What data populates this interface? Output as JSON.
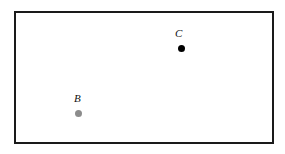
{
  "figure": {
    "type": "geometry-diagram",
    "background_color": "#ffffff",
    "frame": {
      "name": "bounding-rectangle",
      "x": 14,
      "y": 11,
      "width": 256,
      "height": 129,
      "border_color": "#1a1a1a",
      "border_width": 2,
      "fill_color": "#ffffff"
    },
    "points": [
      {
        "label": "C",
        "color": "#000000",
        "radius": 3.5,
        "cx": 181,
        "cy": 48,
        "label_x": 178,
        "label_y": 33
      },
      {
        "label": "B",
        "color": "#8c8c8c",
        "radius": 3.5,
        "cx": 78,
        "cy": 113,
        "label_x": 78,
        "label_y": 99
      }
    ]
  }
}
